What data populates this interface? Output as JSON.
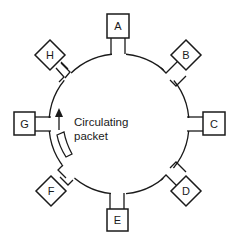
{
  "diagram": {
    "type": "token-ring-network",
    "nodes": [
      {
        "id": "A",
        "label": "A",
        "shape": "square",
        "position": "top"
      },
      {
        "id": "B",
        "label": "B",
        "shape": "diamond",
        "position": "top-right"
      },
      {
        "id": "C",
        "label": "C",
        "shape": "square",
        "position": "right"
      },
      {
        "id": "D",
        "label": "D",
        "shape": "diamond",
        "position": "bottom-right"
      },
      {
        "id": "E",
        "label": "E",
        "shape": "square",
        "position": "bottom"
      },
      {
        "id": "F",
        "label": "F",
        "shape": "diamond",
        "position": "bottom-left"
      },
      {
        "id": "G",
        "label": "G",
        "shape": "square",
        "position": "left"
      },
      {
        "id": "H",
        "label": "H",
        "shape": "diamond",
        "position": "top-left"
      }
    ],
    "packet": {
      "caption_line1": "Circulating",
      "caption_line2": "packet",
      "direction": "clockwise-up"
    },
    "colors": {
      "stroke": "#1a1a1a",
      "background": "#ffffff"
    }
  }
}
